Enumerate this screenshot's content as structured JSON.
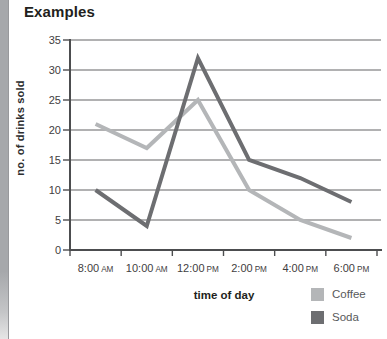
{
  "page": {
    "title": "Examples"
  },
  "chart_data": {
    "type": "line",
    "title": "Examples",
    "categories": [
      "8:00 AM",
      "10:00 AM",
      "12:00 PM",
      "2:00 PM",
      "4:00 PM",
      "6:00 PM"
    ],
    "series": [
      {
        "name": "Coffee",
        "color": "#b4b6b8",
        "values": [
          21,
          17,
          25,
          10,
          5,
          2
        ]
      },
      {
        "name": "Soda",
        "color": "#6d6e71",
        "values": [
          10,
          4,
          32,
          15,
          12,
          8
        ]
      }
    ],
    "xlabel": "time of day",
    "ylabel": "no. of drinks sold",
    "ylim": [
      0,
      35
    ],
    "ytick_step": 5,
    "yticks": [
      0,
      5,
      10,
      15,
      20,
      25,
      30,
      35
    ],
    "grid": true,
    "legend_position": "bottom-right",
    "colors": {
      "grid": "#646567",
      "axis": "#4c4d4f",
      "tick_label": "#3f4041",
      "title_text": "#231f20",
      "legend_text": "#58595b"
    }
  }
}
